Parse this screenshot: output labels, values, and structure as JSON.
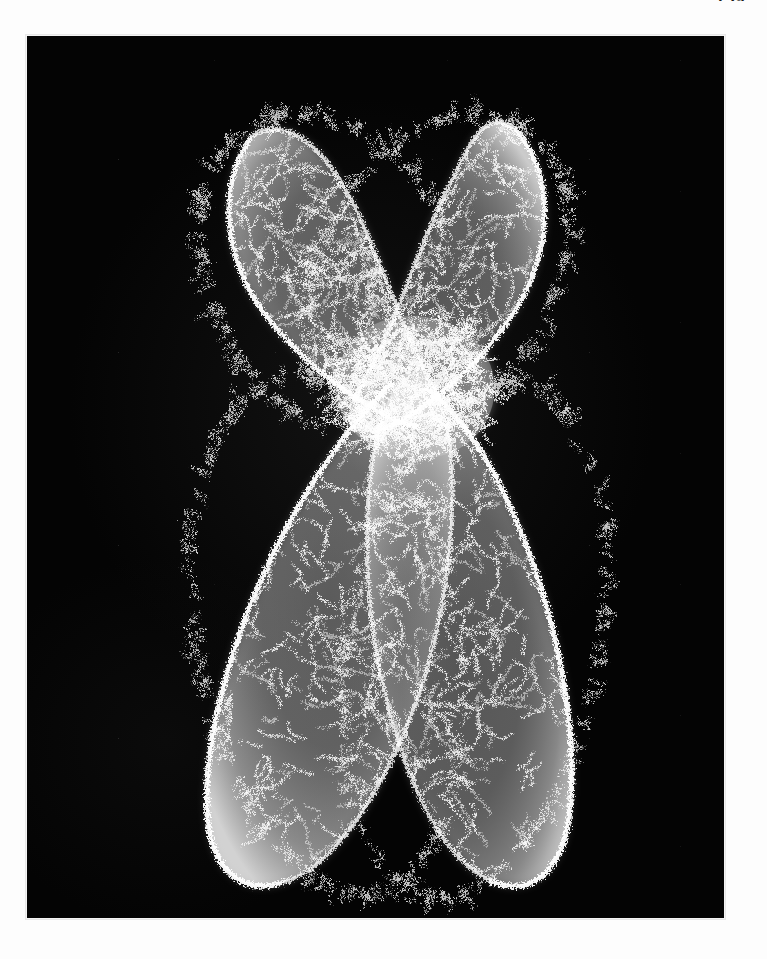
{
  "page": {
    "folio": "159",
    "background_color": "#fdfdfd",
    "width": 767,
    "height": 959
  },
  "plate": {
    "name": "electron-micrograph",
    "background_color": "#040404",
    "fiber_color": "#ffffff",
    "border_color": "#f4f4f4",
    "left": 26,
    "top": 35,
    "width": 699,
    "height": 884,
    "caption": "",
    "subject": "metaphase chromosome",
    "technique": "electron micrograph",
    "magnification_label": "",
    "scale_bar_label": ""
  },
  "specimen": {
    "name": "metaphase-chromosome",
    "description": "Metaphase chromosome composed of two sister chromatids joined at the centromere, each chromatid built from densely folded chromatin fibers.",
    "shape": "X-shaped / butterfly",
    "structures": [
      {
        "id": "short-arm-left",
        "label": "short arm (p) - left chromatid",
        "position": "upper-left"
      },
      {
        "id": "short-arm-right",
        "label": "short arm (p) - right chromatid",
        "position": "upper-right"
      },
      {
        "id": "centromere",
        "label": "centromere / primary constriction",
        "position": "center"
      },
      {
        "id": "long-arm-left",
        "label": "long arm (q) - left chromatid",
        "position": "lower-left"
      },
      {
        "id": "long-arm-right",
        "label": "long arm (q) - long chromatid",
        "position": "lower-right"
      }
    ],
    "texture": "chromatin fibers",
    "fiber_count_visual": 900,
    "centromere_y_fraction": 0.38
  }
}
